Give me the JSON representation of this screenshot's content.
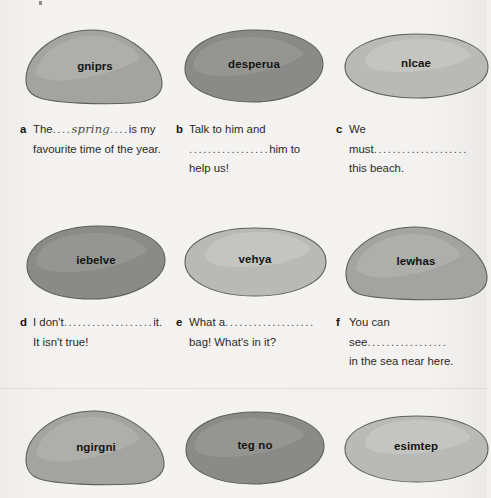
{
  "worksheet": {
    "background_color": "#f2f1ef",
    "blob_colors": {
      "medium": "#a3a3a1",
      "dark": "#8a8a88",
      "light": "#b9b9b5",
      "highlight_medium": "#b0b0ad",
      "highlight_dark": "#979795",
      "highlight_light": "#c6c6c2",
      "outline": "#5e5e5c"
    },
    "rows": [
      {
        "blobs": [
          {
            "word": "gniprs",
            "shape": "teardrop-right",
            "tone": "medium"
          },
          {
            "word": "desperua",
            "shape": "tilted-ellipse",
            "tone": "dark"
          },
          {
            "word": "nlcae",
            "shape": "flat-oval",
            "tone": "light"
          }
        ],
        "exercises": [
          {
            "marker": "a",
            "segments": [
              {
                "type": "text",
                "value": "The"
              },
              {
                "type": "dots",
                "value": "...."
              },
              {
                "type": "handwriting",
                "value": "spring"
              },
              {
                "type": "dots",
                "value": "...."
              },
              {
                "type": "text",
                "value": "is my"
              },
              {
                "type": "break",
                "value": ""
              },
              {
                "type": "text",
                "value": "favourite time of the year."
              }
            ]
          },
          {
            "marker": "b",
            "segments": [
              {
                "type": "text",
                "value": "Talk to him and"
              },
              {
                "type": "break",
                "value": ""
              },
              {
                "type": "dots",
                "value": "................."
              },
              {
                "type": "text",
                "value": "him to"
              },
              {
                "type": "break",
                "value": ""
              },
              {
                "type": "text",
                "value": "help us!"
              }
            ]
          },
          {
            "marker": "c",
            "segments": [
              {
                "type": "text",
                "value": "We must"
              },
              {
                "type": "dots",
                "value": "...................."
              },
              {
                "type": "break",
                "value": ""
              },
              {
                "type": "text",
                "value": "this beach."
              }
            ]
          }
        ]
      },
      {
        "blobs": [
          {
            "word": "iebelve",
            "shape": "tilted-ellipse",
            "tone": "dark"
          },
          {
            "word": "vehya",
            "shape": "flat-oval",
            "tone": "light"
          },
          {
            "word": "lewhas",
            "shape": "teardrop-right",
            "tone": "medium"
          }
        ],
        "exercises": [
          {
            "marker": "d",
            "segments": [
              {
                "type": "text",
                "value": "I don't"
              },
              {
                "type": "dots",
                "value": "..................."
              },
              {
                "type": "text",
                "value": "it."
              },
              {
                "type": "break",
                "value": ""
              },
              {
                "type": "text",
                "value": "It isn't true!"
              }
            ]
          },
          {
            "marker": "e",
            "segments": [
              {
                "type": "text",
                "value": "What a"
              },
              {
                "type": "dots",
                "value": "..................."
              },
              {
                "type": "break",
                "value": ""
              },
              {
                "type": "text",
                "value": "bag! What's in it?"
              }
            ]
          },
          {
            "marker": "f",
            "segments": [
              {
                "type": "text",
                "value": "You can see"
              },
              {
                "type": "dots",
                "value": "................."
              },
              {
                "type": "break",
                "value": ""
              },
              {
                "type": "text",
                "value": "in the sea near here."
              }
            ]
          }
        ]
      },
      {
        "blobs": [
          {
            "word": "ngirgni",
            "shape": "teardrop-right",
            "tone": "medium"
          },
          {
            "word": "teg no",
            "shape": "tilted-ellipse",
            "tone": "dark"
          },
          {
            "word": "esimtep",
            "shape": "flat-oval",
            "tone": "light"
          }
        ],
        "exercises": []
      }
    ]
  }
}
